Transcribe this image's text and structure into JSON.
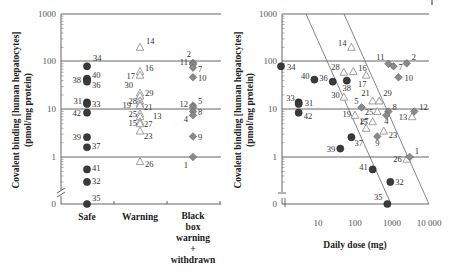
{
  "chart_data": [
    {
      "type": "scatter",
      "panel": "left",
      "ylabel_line1": "Covalent binding [human hepatocytes]",
      "ylabel_line2": "(pmol/mg protein)",
      "yscale": "log",
      "yticks": [
        "1000",
        "100",
        "10",
        "1",
        "0"
      ],
      "ylim": [
        0,
        1000
      ],
      "grid": "horizontal at 1, 10, 100, 1000",
      "categories": [
        "Safe",
        "Warning",
        "Black box warning + withdrawn"
      ],
      "category_labels": [
        [
          "Safe"
        ],
        [
          "Warning"
        ],
        [
          "Black",
          "box",
          "warning",
          "+",
          "withdrawn"
        ]
      ],
      "marker_legend": {
        "Safe": "filled circle (dark)",
        "Warning": "open triangle",
        "Black box warning + withdrawn": "filled diamond (grey)"
      },
      "points": [
        {
          "id": "34",
          "category": "Safe",
          "value": 80
        },
        {
          "id": "38",
          "category": "Safe",
          "value": 42
        },
        {
          "id": "40",
          "category": "Safe",
          "value": 44
        },
        {
          "id": "36",
          "category": "Safe",
          "value": 38
        },
        {
          "id": "31",
          "category": "Safe",
          "value": 14
        },
        {
          "id": "33",
          "category": "Safe",
          "value": 13
        },
        {
          "id": "42",
          "category": "Safe",
          "value": 8.5
        },
        {
          "id": "39",
          "category": "Safe",
          "value": 2.6
        },
        {
          "id": "37",
          "category": "Safe",
          "value": 1.6
        },
        {
          "id": "41",
          "category": "Safe",
          "value": 0.55
        },
        {
          "id": "32",
          "category": "Safe",
          "value": 0.3
        },
        {
          "id": "35",
          "category": "Safe",
          "value": 0
        },
        {
          "id": "14",
          "category": "Warning",
          "value": 200
        },
        {
          "id": "16",
          "category": "Warning",
          "value": 62
        },
        {
          "id": "17",
          "category": "Warning",
          "value": 52
        },
        {
          "id": "30",
          "category": "Warning",
          "value": 22
        },
        {
          "id": "29",
          "category": "Warning",
          "value": 19
        },
        {
          "id": "28",
          "category": "Warning",
          "value": 15
        },
        {
          "id": "19",
          "category": "Warning",
          "value": 13
        },
        {
          "id": "21",
          "category": "Warning",
          "value": 12
        },
        {
          "id": "25",
          "category": "Warning",
          "value": 8
        },
        {
          "id": "13",
          "category": "Warning",
          "value": 7
        },
        {
          "id": "15",
          "category": "Warning",
          "value": 5.5
        },
        {
          "id": "27",
          "category": "Warning",
          "value": 5
        },
        {
          "id": "23",
          "category": "Warning",
          "value": 3.5
        },
        {
          "id": "26",
          "category": "Warning",
          "value": 0.8
        },
        {
          "id": "2",
          "category": "Black box warning + withdrawn",
          "value": 95
        },
        {
          "id": "11",
          "category": "Black box warning + withdrawn",
          "value": 88
        },
        {
          "id": "7",
          "category": "Black box warning + withdrawn",
          "value": 75
        },
        {
          "id": "10",
          "category": "Black box warning + withdrawn",
          "value": 47
        },
        {
          "id": "12",
          "category": "Black box warning + withdrawn",
          "value": 12
        },
        {
          "id": "5",
          "category": "Black box warning + withdrawn",
          "value": 11
        },
        {
          "id": "8",
          "category": "Black box warning + withdrawn",
          "value": 9
        },
        {
          "id": "4",
          "category": "Black box warning + withdrawn",
          "value": 7.5
        },
        {
          "id": "9",
          "category": "Black box warning + withdrawn",
          "value": 2.7
        },
        {
          "id": "1",
          "category": "Black box warning + withdrawn",
          "value": 1
        }
      ]
    },
    {
      "type": "scatter",
      "panel": "right",
      "ylabel_line1": "Covalent binding [human hepatocytes]",
      "ylabel_line2": "(pmol/mg protein)",
      "xlabel": "Daily dose (mg)",
      "xscale": "log",
      "yscale": "log",
      "xticks": [
        "10",
        "100",
        "1000",
        "10 000"
      ],
      "yticks": [
        "1000",
        "100",
        "10",
        "1",
        "0"
      ],
      "xlim": [
        1,
        10000
      ],
      "ylim": [
        0,
        1000
      ],
      "grid": "horizontal at 1, 10, 100, 1000",
      "annotations": [
        "two diagonal zone-separation lines (constant daily body burden)"
      ],
      "points": [
        {
          "id": "34",
          "class": "Safe",
          "dose": 1,
          "value": 80
        },
        {
          "id": "40",
          "class": "Safe",
          "dose": 8,
          "value": 42
        },
        {
          "id": "36",
          "class": "Safe",
          "dose": 25,
          "value": 38
        },
        {
          "id": "38",
          "class": "Safe",
          "dose": 60,
          "value": 40
        },
        {
          "id": "33",
          "class": "Safe",
          "dose": 3,
          "value": 14
        },
        {
          "id": "31",
          "class": "Safe",
          "dose": 3,
          "value": 13
        },
        {
          "id": "42",
          "class": "Safe",
          "dose": 3,
          "value": 8.5
        },
        {
          "id": "39",
          "class": "Safe",
          "dose": 40,
          "value": 1.5
        },
        {
          "id": "37",
          "class": "Safe",
          "dose": 80,
          "value": 2.6
        },
        {
          "id": "41",
          "class": "Safe",
          "dose": 300,
          "value": 0.55
        },
        {
          "id": "32",
          "class": "Safe",
          "dose": 900,
          "value": 0.3
        },
        {
          "id": "35",
          "class": "Safe",
          "dose": 750,
          "value": 0
        },
        {
          "id": "14",
          "class": "Warning",
          "dose": 80,
          "value": 200
        },
        {
          "id": "28",
          "class": "Warning",
          "dose": 50,
          "value": 60
        },
        {
          "id": "16",
          "class": "Warning",
          "dose": 90,
          "value": 62
        },
        {
          "id": "17",
          "class": "Warning",
          "dose": 200,
          "value": 52
        },
        {
          "id": "30",
          "class": "Warning",
          "dose": 50,
          "value": 18
        },
        {
          "id": "21",
          "class": "Warning",
          "dose": 300,
          "value": 15
        },
        {
          "id": "29",
          "class": "Warning",
          "dose": 450,
          "value": 15
        },
        {
          "id": "19",
          "class": "Warning",
          "dose": 100,
          "value": 7.5
        },
        {
          "id": "25",
          "class": "Warning",
          "dose": 400,
          "value": 9
        },
        {
          "id": "15",
          "class": "Warning",
          "dose": 300,
          "value": 5.5
        },
        {
          "id": "27",
          "class": "Warning",
          "dose": 200,
          "value": 4
        },
        {
          "id": "23",
          "class": "Warning",
          "dose": 600,
          "value": 3.5
        },
        {
          "id": "26",
          "class": "Warning",
          "dose": 2500,
          "value": 0.9
        },
        {
          "id": "13",
          "class": "Warning",
          "dose": 3500,
          "value": 7
        },
        {
          "id": "11",
          "class": "Black box warning + withdrawn",
          "dose": 800,
          "value": 90
        },
        {
          "id": "7",
          "class": "Black box warning + withdrawn",
          "dose": 1100,
          "value": 80
        },
        {
          "id": "2",
          "class": "Black box warning + withdrawn",
          "dose": 2500,
          "value": 92
        },
        {
          "id": "10",
          "class": "Black box warning + withdrawn",
          "dose": 1500,
          "value": 47
        },
        {
          "id": "5",
          "class": "Black box warning + withdrawn",
          "dose": 150,
          "value": 11
        },
        {
          "id": "8",
          "class": "Black box warning + withdrawn",
          "dose": 800,
          "value": 9
        },
        {
          "id": "4",
          "class": "Black box warning + withdrawn",
          "dose": 700,
          "value": 7.5
        },
        {
          "id": "9",
          "class": "Black box warning + withdrawn",
          "dose": 400,
          "value": 2.7
        },
        {
          "id": "12",
          "class": "Black box warning + withdrawn",
          "dose": 4000,
          "value": 9
        },
        {
          "id": "1",
          "class": "Black box warning + withdrawn",
          "dose": 3000,
          "value": 1
        }
      ]
    }
  ],
  "colors": {
    "safe_marker": "#3a3a3a",
    "bbw_marker": "#8a8a8a",
    "warning_marker": "#888888",
    "gridline": "#555555",
    "text": "#333333"
  },
  "labels": {
    "ylabel_line1": "Covalent binding [human hepatocytes]",
    "ylabel_line2": "(pmol/mg protein)",
    "xlabel_right": "Daily dose (mg)",
    "ytick_1000": "1000",
    "ytick_100": "100",
    "ytick_10": "10",
    "ytick_1": "1",
    "ytick_0": "0",
    "xtick_10": "10",
    "xtick_100": "100",
    "xtick_1000": "1000",
    "xtick_10000": "10 000",
    "cat_safe": "Safe",
    "cat_warning": "Warning",
    "cat_bbw_1": "Black",
    "cat_bbw_2": "box",
    "cat_bbw_3": "warning",
    "cat_bbw_4": "+",
    "cat_bbw_5": "withdrawn"
  }
}
